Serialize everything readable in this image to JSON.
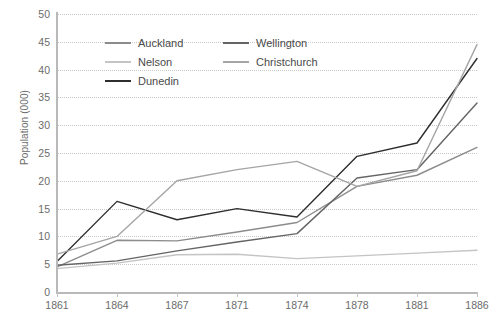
{
  "chart_data": {
    "type": "line",
    "title": "",
    "xlabel": "",
    "ylabel": "Population (000)",
    "categories": [
      "1861",
      "1864",
      "1867",
      "1871",
      "1874",
      "1878",
      "1881",
      "1886"
    ],
    "ylim": [
      0,
      50
    ],
    "ytick_step": 5,
    "yticks": [
      "0",
      "5",
      "10",
      "15",
      "20",
      "25",
      "30",
      "35",
      "40",
      "45",
      "50"
    ],
    "grid": "horizontal-dotted",
    "legend_position": "top-left-inside",
    "series": [
      {
        "name": "Auckland",
        "color": "#8c8c8c",
        "values": [
          4.5,
          9.3,
          9.2,
          10.8,
          12.5,
          19.0,
          21.0,
          26.0
        ]
      },
      {
        "name": "Nelson",
        "color": "#c4c4c4",
        "values": [
          4.2,
          5.2,
          6.7,
          6.8,
          6.0,
          6.5,
          7.0,
          7.5
        ]
      },
      {
        "name": "Dunedin",
        "color": "#2e2e2e",
        "values": [
          5.5,
          16.3,
          13.0,
          15.0,
          13.5,
          24.4,
          26.8,
          42.0
        ]
      },
      {
        "name": "Wellington",
        "color": "#646464",
        "values": [
          4.8,
          5.6,
          7.4,
          9.0,
          10.5,
          20.5,
          22.0,
          34.0
        ]
      },
      {
        "name": "Christchurch",
        "color": "#a5a5a5",
        "values": [
          6.8,
          10.0,
          20.0,
          22.0,
          23.5,
          19.0,
          21.8,
          44.5
        ]
      }
    ]
  },
  "legend": {
    "items": [
      {
        "label": "Auckland"
      },
      {
        "label": "Wellington"
      },
      {
        "label": "Nelson"
      },
      {
        "label": "Christchurch"
      },
      {
        "label": "Dunedin"
      }
    ],
    "order": [
      0,
      3,
      1,
      4,
      2
    ]
  },
  "style": {
    "axis_color": "#b9b9b9",
    "grid_color": "#c9c9c9",
    "tick_text_color": "#6b6b6b",
    "background": "#ffffff"
  }
}
